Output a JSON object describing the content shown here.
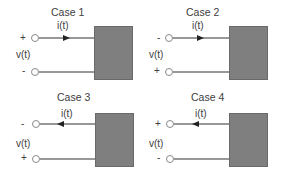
{
  "diagram": {
    "type": "two-terminal network sign conventions",
    "colors": {
      "box": "#7f7f7f",
      "wire": "#333333",
      "text": "#404040"
    },
    "cases": [
      {
        "title": "Case 1",
        "current_label": "i(t)",
        "current_direction": "right",
        "voltage_label": "v(t)",
        "top_sign": "+",
        "bottom_sign": "-"
      },
      {
        "title": "Case 2",
        "current_label": "i(t)",
        "current_direction": "right",
        "voltage_label": "v(t)",
        "top_sign": "-",
        "bottom_sign": "+"
      },
      {
        "title": "Case 3",
        "current_label": "i(t)",
        "current_direction": "left",
        "voltage_label": "v(t)",
        "top_sign": "-",
        "bottom_sign": "+"
      },
      {
        "title": "Case 4",
        "current_label": "i(t)",
        "current_direction": "left",
        "voltage_label": "v(t)",
        "top_sign": "+",
        "bottom_sign": "-"
      }
    ]
  }
}
